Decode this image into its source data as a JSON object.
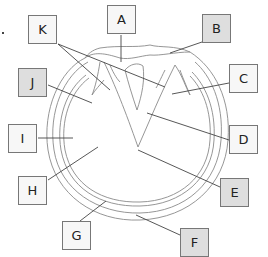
{
  "labels": {
    "A": "A",
    "B": "B",
    "C": "C",
    "D": "D",
    "E": "E",
    "F": "F",
    "G": "G",
    "H": "H",
    "I": "I",
    "J": "J",
    "K": "K"
  },
  "colors": {
    "line": "#444444",
    "sketch": "#8a8a8a",
    "box_border": "#777777",
    "box_white": "#f7f7f7",
    "box_gray": "#dedede"
  }
}
